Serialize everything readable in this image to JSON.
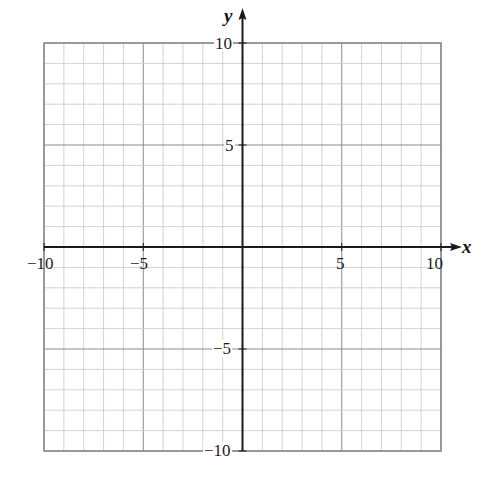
{
  "chart_data": {
    "type": "scatter",
    "title": "",
    "xlabel": "x",
    "ylabel": "y",
    "xlim": [
      -10,
      10
    ],
    "ylim": [
      -10,
      10
    ],
    "grid": true,
    "grid_minor_step": 1,
    "grid_major_step": 5,
    "x_ticks": [
      "-10",
      "-5",
      "5",
      "10"
    ],
    "y_ticks": [
      "10",
      "5",
      "-5",
      "-10"
    ],
    "series": [],
    "legend": null
  },
  "labels": {
    "x_axis": "x",
    "y_axis": "y",
    "x_neg10": "−10",
    "x_neg5": "−5",
    "x_5": "5",
    "x_10": "10",
    "y_10": "10",
    "y_5": "5",
    "y_neg5": "−5",
    "y_neg10": "−10"
  },
  "colors": {
    "minor_grid": "#c8c8c8",
    "major_grid": "#8a8a8a",
    "axis": "#1a1a1a",
    "border": "#8a8a8a"
  }
}
